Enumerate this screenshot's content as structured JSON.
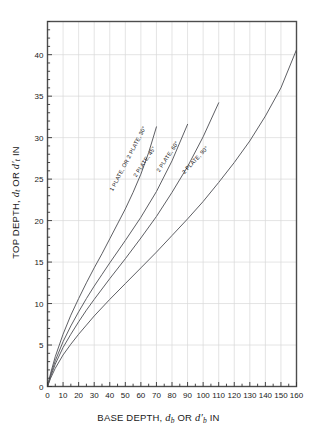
{
  "figure": {
    "background": "#ffffff",
    "frame_color": "#4d4d4d",
    "grid_color": "#d9d9d9",
    "curve_color": "#55565c",
    "tick_color": "#333333",
    "text_color": "#1a1a1a"
  },
  "axes": {
    "x": {
      "label_prefix": "BASE DEPTH, ",
      "label_var1": "d",
      "label_sub1": "b",
      "label_mid": " OR ",
      "label_var2": "d′",
      "label_sub2": "b",
      "label_suffix": "  IN",
      "full_label": "BASE DEPTH, d_b OR d'_b  IN",
      "min": 0,
      "max": 160,
      "major_step": 10,
      "minor_step": 5,
      "ticks": [
        0,
        10,
        20,
        30,
        40,
        50,
        60,
        70,
        80,
        90,
        100,
        110,
        120,
        130,
        140,
        150,
        160
      ]
    },
    "y": {
      "label_prefix": "TOP DEPTH, ",
      "label_var1": "d",
      "label_sub1": "t",
      "label_mid": " OR ",
      "label_var2": "d′",
      "label_sub2": "t",
      "label_suffix": "  IN",
      "full_label": "TOP DEPTH, d_t OR d'_t  IN",
      "min": 0,
      "max": 44,
      "major_step": 5,
      "minor_step": 1,
      "ticks": [
        0,
        5,
        10,
        15,
        20,
        25,
        30,
        35,
        40
      ]
    }
  },
  "chart_data": {
    "type": "line",
    "title": "",
    "xlabel": "BASE DEPTH, d_b OR d'_b  IN",
    "ylabel": "TOP DEPTH, d_t OR d'_t  IN",
    "xlim": [
      0,
      160
    ],
    "ylim": [
      0,
      44
    ],
    "grid": true,
    "legend": "inline-curve-labels",
    "series": [
      {
        "name": "1 PLATE, OR 2 PLATE, 30°",
        "label": "1 PLATE, OR 2 PLATE, 30°",
        "label_at": {
          "x": 42,
          "y": 23.5
        },
        "x": [
          0,
          2,
          5,
          10,
          15,
          20,
          25,
          30,
          35,
          40,
          45,
          50,
          55,
          60,
          65,
          70
        ],
        "y": [
          0,
          1.6,
          3.6,
          6.3,
          8.6,
          10.6,
          12.5,
          14.3,
          16.0,
          17.8,
          19.6,
          21.4,
          23.4,
          25.6,
          28.2,
          31.3
        ]
      },
      {
        "name": "2 PLATE, 45°",
        "label": "2 PLATE, 45°",
        "label_at": {
          "x": 57,
          "y": 25.2
        },
        "x": [
          0,
          2,
          5,
          10,
          15,
          20,
          25,
          30,
          35,
          40,
          50,
          60,
          70,
          80,
          90
        ],
        "y": [
          0,
          1.4,
          3.1,
          5.4,
          7.3,
          9.0,
          10.6,
          12.1,
          13.5,
          14.9,
          17.6,
          20.4,
          23.5,
          27.2,
          31.6
        ]
      },
      {
        "name": "2 PLATE, 60°",
        "label": "2 PLATE, 60°",
        "label_at": {
          "x": 72,
          "y": 25.8
        },
        "x": [
          0,
          2,
          5,
          10,
          15,
          20,
          25,
          30,
          40,
          50,
          60,
          70,
          80,
          90,
          100,
          110
        ],
        "y": [
          0,
          1.2,
          2.7,
          4.7,
          6.3,
          7.8,
          9.2,
          10.5,
          13.0,
          15.4,
          17.9,
          20.5,
          23.4,
          26.5,
          30.1,
          34.2
        ]
      },
      {
        "name": "2 PLATE, 90°",
        "label": "2 PLATE, 90°",
        "label_at": {
          "x": 88,
          "y": 25.6
        },
        "x": [
          0,
          2,
          5,
          10,
          15,
          20,
          25,
          30,
          40,
          50,
          60,
          70,
          80,
          90,
          100,
          110,
          120,
          130,
          140,
          150,
          160
        ],
        "y": [
          0,
          1.0,
          2.2,
          3.8,
          5.1,
          6.3,
          7.4,
          8.5,
          10.5,
          12.4,
          14.3,
          16.2,
          18.2,
          20.2,
          22.3,
          24.6,
          27.0,
          29.6,
          32.6,
          36.0,
          40.6
        ]
      }
    ]
  }
}
